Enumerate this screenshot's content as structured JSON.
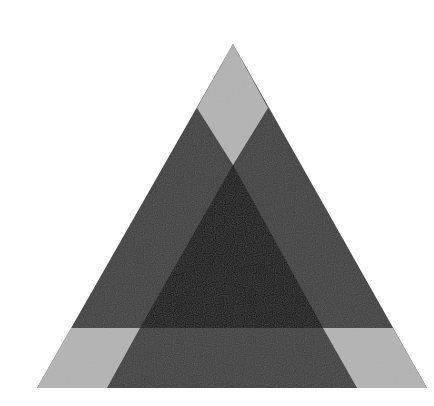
{
  "figure": {
    "description": "Large triangle subdivided into overlapping regions: light gray corner regions, dark gray overlap bands, black central triangle",
    "colors": {
      "background": "#ffffff",
      "light": "#b4b4b4",
      "dark": "#3c3c3c",
      "center": "#040404"
    },
    "outer_triangle": [
      [
        233,
        44
      ],
      [
        37,
        388
      ],
      [
        427,
        388
      ]
    ],
    "regions": {
      "top_light_diamond": [
        [
          233,
          44
        ],
        [
          268,
          108
        ],
        [
          233,
          165
        ],
        [
          197,
          108
        ]
      ],
      "bottom_left_light": [
        [
          71,
          328
        ],
        [
          140,
          328
        ],
        [
          107,
          388
        ],
        [
          37,
          388
        ]
      ],
      "bottom_right_light": [
        [
          323,
          328
        ],
        [
          393,
          328
        ],
        [
          427,
          388
        ],
        [
          357,
          388
        ]
      ],
      "center_black": [
        [
          233,
          165
        ],
        [
          140,
          328
        ],
        [
          323,
          328
        ]
      ]
    }
  }
}
